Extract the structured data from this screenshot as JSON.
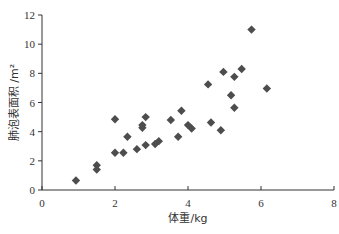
{
  "chart_data": {
    "type": "scatter",
    "title": "",
    "xlabel": "体重/kg",
    "ylabel": "肺泡表面积 /m²",
    "xlim": [
      0,
      8
    ],
    "ylim": [
      0,
      12
    ],
    "xticks": [
      0,
      2,
      4,
      6,
      8
    ],
    "yticks": [
      0,
      2,
      4,
      6,
      8,
      10,
      12
    ],
    "grid": false,
    "legend": null,
    "marker": "diamond",
    "marker_color": "#4d4d4d",
    "points": [
      {
        "x": 0.93,
        "y": 0.65
      },
      {
        "x": 1.5,
        "y": 1.7
      },
      {
        "x": 1.5,
        "y": 1.4
      },
      {
        "x": 2.0,
        "y": 4.85
      },
      {
        "x": 2.0,
        "y": 2.55
      },
      {
        "x": 2.23,
        "y": 2.55
      },
      {
        "x": 2.34,
        "y": 3.65
      },
      {
        "x": 2.6,
        "y": 2.8
      },
      {
        "x": 2.75,
        "y": 4.45
      },
      {
        "x": 2.75,
        "y": 4.27
      },
      {
        "x": 2.84,
        "y": 5.0
      },
      {
        "x": 2.84,
        "y": 3.08
      },
      {
        "x": 3.1,
        "y": 3.15
      },
      {
        "x": 3.2,
        "y": 3.35
      },
      {
        "x": 3.53,
        "y": 4.8
      },
      {
        "x": 3.73,
        "y": 3.65
      },
      {
        "x": 3.82,
        "y": 5.43
      },
      {
        "x": 4.0,
        "y": 4.45
      },
      {
        "x": 4.1,
        "y": 4.22
      },
      {
        "x": 4.55,
        "y": 7.24
      },
      {
        "x": 4.63,
        "y": 4.63
      },
      {
        "x": 4.9,
        "y": 4.1
      },
      {
        "x": 4.97,
        "y": 8.1
      },
      {
        "x": 5.18,
        "y": 6.5
      },
      {
        "x": 5.27,
        "y": 7.76
      },
      {
        "x": 5.27,
        "y": 5.64
      },
      {
        "x": 5.47,
        "y": 8.3
      },
      {
        "x": 5.74,
        "y": 11.0
      },
      {
        "x": 6.16,
        "y": 6.96
      }
    ]
  }
}
